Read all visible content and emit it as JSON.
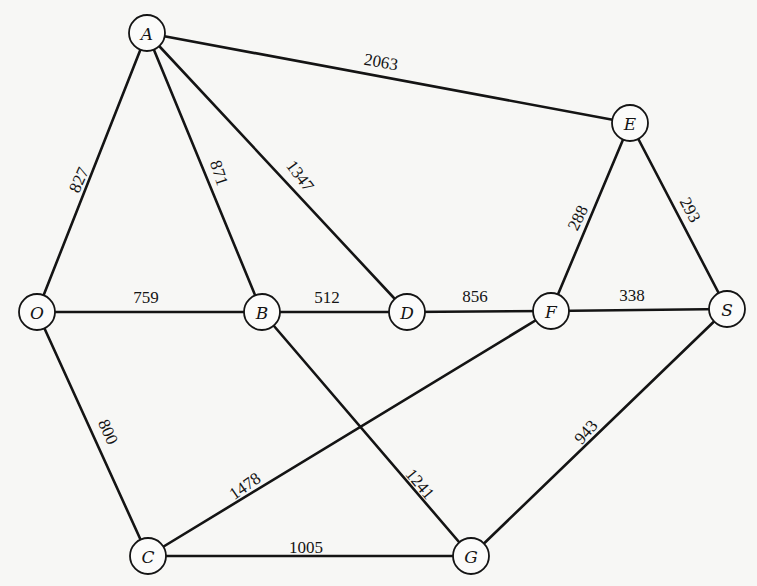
{
  "diagram": {
    "type": "weighted-undirected-graph",
    "node_radius": 18,
    "nodes": [
      {
        "id": "A",
        "label": "A",
        "x": 147,
        "y": 33
      },
      {
        "id": "E",
        "label": "E",
        "x": 630,
        "y": 123
      },
      {
        "id": "O",
        "label": "O",
        "x": 37,
        "y": 312
      },
      {
        "id": "B",
        "label": "B",
        "x": 262,
        "y": 312
      },
      {
        "id": "D",
        "label": "D",
        "x": 407,
        "y": 312
      },
      {
        "id": "F",
        "label": "F",
        "x": 551,
        "y": 311
      },
      {
        "id": "S",
        "label": "S",
        "x": 727,
        "y": 309
      },
      {
        "id": "C",
        "label": "C",
        "x": 148,
        "y": 556
      },
      {
        "id": "G",
        "label": "G",
        "x": 471,
        "y": 556
      }
    ],
    "edges": [
      {
        "from": "A",
        "to": "E",
        "weight": "2063",
        "lx": 381,
        "ly": 62,
        "rot": 10
      },
      {
        "from": "A",
        "to": "O",
        "weight": "827",
        "lx": 79,
        "ly": 180,
        "rot": -66
      },
      {
        "from": "A",
        "to": "B",
        "weight": "871",
        "lx": 219,
        "ly": 173,
        "rot": 72
      },
      {
        "from": "A",
        "to": "D",
        "weight": "1347",
        "lx": 300,
        "ly": 176,
        "rot": 53
      },
      {
        "from": "E",
        "to": "F",
        "weight": "288",
        "lx": 578,
        "ly": 218,
        "rot": -64
      },
      {
        "from": "E",
        "to": "S",
        "weight": "293",
        "lx": 690,
        "ly": 210,
        "rot": 62
      },
      {
        "from": "O",
        "to": "B",
        "weight": "759",
        "lx": 146,
        "ly": 297,
        "rot": 0
      },
      {
        "from": "B",
        "to": "D",
        "weight": "512",
        "lx": 327,
        "ly": 297,
        "rot": 0
      },
      {
        "from": "D",
        "to": "F",
        "weight": "856",
        "lx": 475,
        "ly": 296,
        "rot": 0
      },
      {
        "from": "F",
        "to": "S",
        "weight": "338",
        "lx": 632,
        "ly": 295,
        "rot": 0
      },
      {
        "from": "O",
        "to": "C",
        "weight": "800",
        "lx": 108,
        "ly": 432,
        "rot": 66
      },
      {
        "from": "B",
        "to": "G",
        "weight": "1241",
        "lx": 420,
        "ly": 484,
        "rot": 50
      },
      {
        "from": "C",
        "to": "F",
        "weight": "1478",
        "lx": 245,
        "ly": 486,
        "rot": -35
      },
      {
        "from": "S",
        "to": "G",
        "weight": "943",
        "lx": 586,
        "ly": 432,
        "rot": -49
      },
      {
        "from": "C",
        "to": "G",
        "weight": "1005",
        "lx": 306,
        "ly": 547,
        "rot": 0
      }
    ]
  }
}
